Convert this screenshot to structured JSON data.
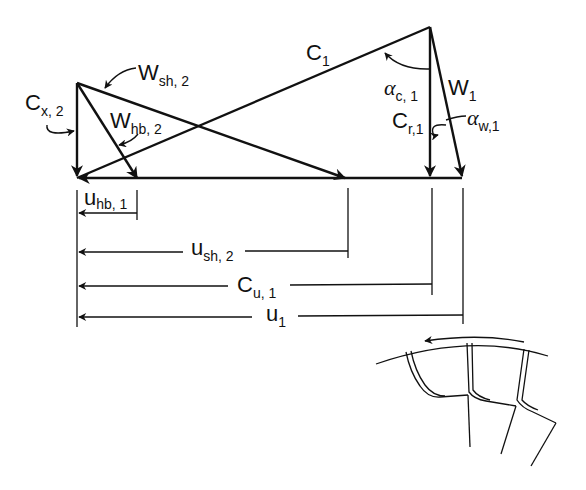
{
  "diagram": {
    "colors": {
      "ink": "#111111",
      "background": "#ffffff"
    },
    "labels": {
      "C1": {
        "main": "C",
        "sub": "1"
      },
      "W1": {
        "main": "W",
        "sub": "1"
      },
      "Cr1": {
        "main": "C",
        "sub": "r,1"
      },
      "alpha_c1": {
        "main": "α",
        "sub": "c, 1"
      },
      "alpha_w1": {
        "main": "α",
        "sub": "w,1"
      },
      "Cx2": {
        "main": "C",
        "sub": "x, 2"
      },
      "Wsh2": {
        "main": "W",
        "sub": "sh, 2"
      },
      "Whb2": {
        "main": "W",
        "sub": "hb, 2"
      },
      "uhb1": {
        "main": "u",
        "sub": "hb, 1"
      },
      "ush2": {
        "main": "u",
        "sub": "sh, 2"
      },
      "Cu1": {
        "main": "C",
        "sub": "u, 1"
      },
      "u1": {
        "main": "u",
        "sub": "1"
      }
    },
    "vectors": [
      {
        "name": "C1",
        "from": [
          77,
          178
        ],
        "to": [
          430,
          27
        ]
      },
      {
        "name": "Cr1",
        "from": [
          430,
          27
        ],
        "to": [
          430,
          178
        ]
      },
      {
        "name": "W1",
        "from": [
          430,
          27
        ],
        "to": [
          462,
          178
        ]
      },
      {
        "name": "Cx2",
        "from": [
          77,
          83
        ],
        "to": [
          77,
          178
        ]
      },
      {
        "name": "Wsh2",
        "from": [
          77,
          83
        ],
        "to": [
          345,
          178
        ]
      },
      {
        "name": "Whb2",
        "from": [
          77,
          83
        ],
        "to": [
          137,
          178
        ]
      },
      {
        "name": "baseline_u",
        "from": [
          462,
          178
        ],
        "to": [
          77,
          178
        ]
      }
    ],
    "dimensions": [
      {
        "name": "uhb1",
        "x_end": 137,
        "y": 213
      },
      {
        "name": "ush2",
        "x_end": 348,
        "y": 252
      },
      {
        "name": "Cu1",
        "x_end": 432,
        "y": 286
      },
      {
        "name": "u1",
        "x_end": 463,
        "y": 317
      }
    ],
    "impeller_sketch": {
      "description": "Impeller blade sketch with rotation arrow"
    }
  }
}
